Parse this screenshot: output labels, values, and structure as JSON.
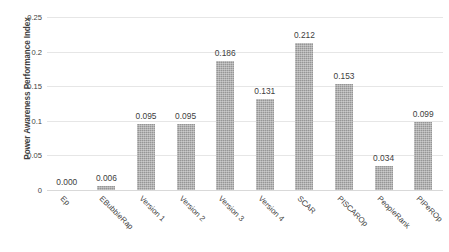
{
  "chart_data": {
    "type": "bar",
    "title": "",
    "xlabel": "",
    "ylabel": "Power Awareness Performance Index",
    "ylim": [
      0,
      0.25
    ],
    "ytick_labels": [
      "0",
      "0.05",
      "0.1",
      "0.15",
      "0.2",
      "0.25"
    ],
    "ytick_values": [
      0,
      0.05,
      0.1,
      0.15,
      0.2,
      0.25
    ],
    "grid": true,
    "legend": "none",
    "bar_color": "#969696",
    "gridline_color": "#e6e6e6",
    "categories": [
      "Ep",
      "EBubbleRap",
      "Version 1",
      "Version 2",
      "Version 3",
      "Version 4",
      "SCAR",
      "PISCAROp",
      "PeopleRank",
      "PIPeROp"
    ],
    "values": [
      0.0,
      0.006,
      0.095,
      0.095,
      0.186,
      0.131,
      0.212,
      0.153,
      0.034,
      0.099
    ],
    "value_labels": [
      "0.000",
      "0.006",
      "0.095",
      "0.095",
      "0.186",
      "0.131",
      "0.212",
      "0.153",
      "0.034",
      "0.099"
    ]
  }
}
